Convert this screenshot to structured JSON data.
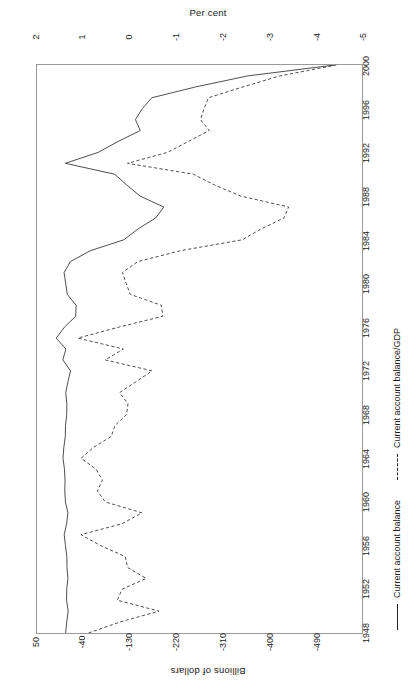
{
  "figure": {
    "top_axis_title": "Per cent",
    "bottom_axis_title": "Billions of dollars",
    "orientation": "rotated-90-ccw"
  },
  "top_ticks": [
    {
      "label": "2",
      "x": 36
    },
    {
      "label": "1",
      "x": 82
    },
    {
      "label": "0",
      "x": 129
    },
    {
      "label": "-1",
      "x": 176
    },
    {
      "label": "-2",
      "x": 223
    },
    {
      "label": "-3",
      "x": 270
    },
    {
      "label": "-4",
      "x": 317
    },
    {
      "label": "-5",
      "x": 363
    }
  ],
  "bottom_ticks": [
    {
      "label": "50",
      "x": 36
    },
    {
      "label": "-40",
      "x": 82
    },
    {
      "label": "-130",
      "x": 129
    },
    {
      "label": "-220",
      "x": 176
    },
    {
      "label": "-310",
      "x": 223
    },
    {
      "label": "-400",
      "x": 270
    },
    {
      "label": "-490",
      "x": 317
    }
  ],
  "year_ticks": [
    {
      "label": "1948",
      "y": 568
    },
    {
      "label": "1952",
      "y": 524
    },
    {
      "label": "1956",
      "y": 481
    },
    {
      "label": "1960",
      "y": 437
    },
    {
      "label": "1964",
      "y": 394
    },
    {
      "label": "1968",
      "y": 350
    },
    {
      "label": "1972",
      "y": 306
    },
    {
      "label": "1976",
      "y": 263
    },
    {
      "label": "1980",
      "y": 219
    },
    {
      "label": "1984",
      "y": 176
    },
    {
      "label": "1988",
      "y": 132
    },
    {
      "label": "1992",
      "y": 88
    },
    {
      "label": "1996",
      "y": 45
    },
    {
      "label": "2000",
      "y": 1
    }
  ],
  "legend": [
    {
      "label": "Current account balance",
      "style": "solid",
      "offset": 0
    },
    {
      "label": "Current account balance/GDP",
      "style": "dashed",
      "offset": 150
    }
  ],
  "chart_data": {
    "type": "line",
    "title": "",
    "xlabel": "",
    "ylabel": "Per cent / Billions of dollars",
    "note": "US current account balance, annual 1948-2000. Chart is drawn rotated 90 degrees counter-clockwise: years run bottom-to-top on the vertical axis, values run left(positive)-to-right(negative) on the horizontal axis.",
    "grid": false,
    "legend_position": "right",
    "x": [
      1948,
      1949,
      1950,
      1951,
      1952,
      1953,
      1954,
      1955,
      1956,
      1957,
      1958,
      1959,
      1960,
      1961,
      1962,
      1963,
      1964,
      1965,
      1966,
      1967,
      1968,
      1969,
      1970,
      1971,
      1972,
      1973,
      1974,
      1975,
      1976,
      1977,
      1978,
      1979,
      1980,
      1981,
      1982,
      1983,
      1984,
      1985,
      1986,
      1987,
      1988,
      1989,
      1990,
      1991,
      1992,
      1993,
      1994,
      1995,
      1996,
      1997,
      1998,
      1999,
      2000
    ],
    "xlim": [
      1948,
      2000
    ],
    "series": [
      {
        "name": "Current account balance",
        "style": "solid",
        "units": "Billions of dollars",
        "axis": "bottom",
        "axis_ticks": [
          50,
          -40,
          -130,
          -220,
          -310,
          -400,
          -490
        ],
        "axis_lim": [
          50,
          -490
        ],
        "values": [
          2.4,
          0.6,
          -1.8,
          0.9,
          0.6,
          -1.3,
          0.2,
          0.4,
          2.7,
          4.8,
          0.8,
          -1.3,
          2.8,
          3.8,
          3.4,
          4.4,
          6.8,
          5.4,
          3.0,
          2.6,
          0.6,
          0.4,
          2.3,
          -1.4,
          -5.8,
          7.1,
          2.0,
          18.1,
          4.3,
          -14.3,
          -15.1,
          -0.3,
          2.3,
          5.0,
          -5.5,
          -38.7,
          -94.3,
          -118.2,
          -147.2,
          -160.7,
          -121.2,
          -99.5,
          -79.0,
          2.9,
          -51.6,
          -84.8,
          -121.6,
          -113.6,
          -124.8,
          -140.7,
          -214.1,
          -300.1,
          -444.7
        ]
      },
      {
        "name": "Current account balance/GDP",
        "style": "dashed",
        "units": "Per cent",
        "axis": "top",
        "axis_ticks": [
          2,
          1,
          0,
          -1,
          -2,
          -3,
          -4,
          -5
        ],
        "axis_lim": [
          2,
          -5
        ],
        "values": [
          0.89,
          0.22,
          -0.63,
          0.27,
          0.17,
          -0.35,
          0.05,
          0.1,
          0.63,
          1.05,
          0.17,
          -0.26,
          0.53,
          0.7,
          0.59,
          0.73,
          1.05,
          0.78,
          0.4,
          0.32,
          0.07,
          0.04,
          0.22,
          -0.13,
          -0.48,
          0.53,
          0.14,
          1.12,
          0.24,
          -0.71,
          -0.68,
          -0.01,
          0.08,
          0.16,
          -0.17,
          -1.09,
          -2.42,
          -2.83,
          -3.32,
          -3.42,
          -2.39,
          -1.83,
          -1.37,
          0.05,
          -0.81,
          -1.26,
          -1.71,
          -1.52,
          -1.6,
          -1.69,
          -2.44,
          -3.23,
          -4.45
        ]
      }
    ]
  }
}
